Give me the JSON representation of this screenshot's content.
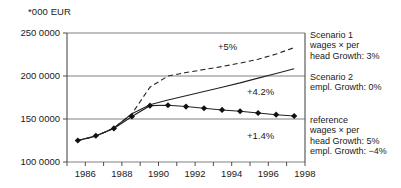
{
  "chart_data": {
    "type": "line",
    "title": "*000 EUR",
    "xlabel": "",
    "ylabel": "*000 EUR",
    "x": [
      1986,
      1987,
      1988,
      1989,
      1990,
      1991,
      1992,
      1993,
      1994,
      1995,
      1996,
      1997,
      1998
    ],
    "xlim": [
      1985.4,
      1998.6
    ],
    "ylim": [
      1000000,
      2500000
    ],
    "grid": true,
    "gridlines_y": [
      1000000,
      1500000,
      2000000,
      2500000
    ],
    "ytick_labels": [
      "250 0000",
      "200 0000",
      "150 0000",
      "100 0000"
    ],
    "ytick_values": [
      2500000,
      2000000,
      1500000,
      1000000
    ],
    "xtick_labels": [
      "1986",
      "1988",
      "1990",
      "1992",
      "1994",
      "1996",
      "1998"
    ],
    "xtick_values": [
      1986,
      1988,
      1990,
      1992,
      1994,
      1996,
      1998
    ],
    "xtick_minor_values": [
      1987,
      1989,
      1991,
      1993,
      1995,
      1997
    ],
    "legend_position": "right",
    "series": [
      {
        "name": "Scenario 1",
        "style": "dashed",
        "marker": "none",
        "color": "#222222",
        "annotation": "+5%",
        "values": [
          1250000,
          1300000,
          1395000,
          1560000,
          1870000,
          2000000,
          2040000,
          2075000,
          2110000,
          2150000,
          2195000,
          2255000,
          2330000
        ]
      },
      {
        "name": "Scenario 2",
        "style": "solid",
        "marker": "none",
        "color": "#222222",
        "annotation": "+4.2%",
        "values": [
          1250000,
          1300000,
          1395000,
          1560000,
          1665000,
          1720000,
          1770000,
          1820000,
          1870000,
          1920000,
          1975000,
          2030000,
          2085000
        ]
      },
      {
        "name": "reference",
        "style": "solid",
        "marker": "diamond",
        "color": "#222222",
        "annotation": "+1.4%",
        "values": [
          1250000,
          1305000,
          1390000,
          1530000,
          1655000,
          1660000,
          1645000,
          1625000,
          1605000,
          1590000,
          1570000,
          1550000,
          1535000
        ]
      }
    ],
    "annotations": [
      {
        "text": "+5%",
        "x": 1991.1,
        "y": 2195000
      },
      {
        "text": "+4.2%",
        "x": 1996.0,
        "y": 1800000
      },
      {
        "text": "+1.4%",
        "x": 1996.0,
        "y": 1395000
      }
    ]
  },
  "legend": {
    "entries": [
      {
        "key": "scenario-1",
        "lines": [
          "Scenario 1",
          "wages × per",
          "head Growth: 3%"
        ]
      },
      {
        "key": "scenario-2",
        "lines": [
          "Scenario 2",
          "empl.  Growth: 0%"
        ]
      },
      {
        "key": "reference",
        "lines": [
          "reference",
          "wages × per",
          "head Growth: 5%",
          "empl. Growth: −4%"
        ]
      }
    ]
  },
  "style": {
    "line_color": "#222222",
    "grid_color": "#808080",
    "axis_color": "#4d4d4d",
    "text_color": "#1a1a1a",
    "background": "#ffffff"
  }
}
